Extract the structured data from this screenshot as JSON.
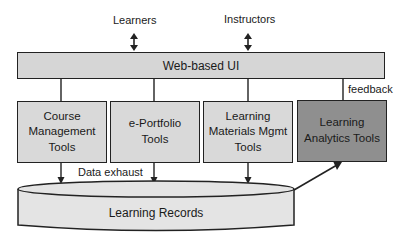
{
  "diagram": {
    "actors": [
      {
        "label": "Learners"
      },
      {
        "label": "Instructors"
      }
    ],
    "ui_layer": {
      "label": "Web-based UI"
    },
    "tools": [
      {
        "lines": [
          "Course",
          "Management",
          "Tools"
        ],
        "fill": "#d9d9d9"
      },
      {
        "lines": [
          "e-Portfolio",
          "Tools"
        ],
        "fill": "#d9d9d9"
      },
      {
        "lines": [
          "Learning",
          "Materials Mgmt",
          "Tools"
        ],
        "fill": "#d9d9d9"
      },
      {
        "lines": [
          "Learning",
          "Analytics Tools"
        ],
        "fill": "#8f8f8f"
      }
    ],
    "edge_labels": {
      "feedback": "feedback",
      "data_exhaust": "Data exhaust"
    },
    "store": {
      "label": "Learning Records"
    },
    "colors": {
      "stroke": "#222222",
      "light_fill": "#d9d9d9",
      "dark_fill": "#8f8f8f",
      "store_fill": "#e4e4e4"
    }
  }
}
